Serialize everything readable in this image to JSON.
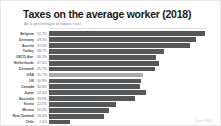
{
  "chart_data": {
    "type": "bar",
    "orientation": "horizontal",
    "title": "Taxes on the average worker (2018)",
    "subtitle": "As a percentage of labour cost",
    "xlabel": "",
    "ylabel": "",
    "xlim": [
      0,
      55
    ],
    "grid": false,
    "legend": null,
    "highlight_category": "USA",
    "colors": {
      "bar": "#555759",
      "bar_highlight": "#a9abad",
      "title": "#1a1a1a",
      "subtitle": "#8a8a8a",
      "label": "#4a4a4a",
      "value": "#6e6e6e",
      "card_border": "#e6e6e6",
      "background": "#ffffff"
    },
    "categories": [
      "Belgium",
      "Germany",
      "Austria",
      "Turkey",
      "OECD Ave.",
      "Netherlands",
      "Denmark",
      "USA",
      "UK",
      "Canada",
      "Japan",
      "Australia",
      "Korea",
      "Mexico",
      "New Zealand",
      "Chile"
    ],
    "values": [
      52.7,
      49.5,
      47.6,
      38.7,
      36.1,
      37.0,
      35.7,
      31.7,
      30.9,
      30.8,
      32.6,
      28.9,
      22.6,
      20.4,
      18.4,
      7.0
    ],
    "value_labels": [
      "52.7%",
      "49.5%",
      "47.6%",
      "38.7%",
      "36.1%",
      "37.0%",
      "35.7%",
      "31.7%",
      "30.9%",
      "30.8%",
      "32.6%",
      "28.9%",
      "22.6%",
      "20.4%",
      "18.4%",
      "7.0%"
    ]
  },
  "credit": "Source: OECD"
}
